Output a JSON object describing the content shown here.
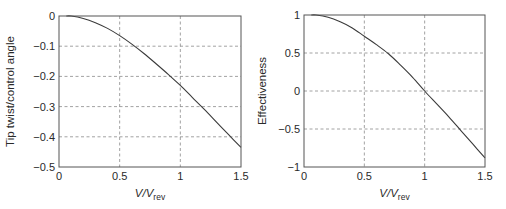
{
  "chart_data": [
    {
      "type": "line",
      "title": "",
      "xlabel": "V/V_rev",
      "xlabel_main": "V/V",
      "xlabel_sub": "rev",
      "ylabel": "Tip twist/control angle",
      "xlim": [
        0,
        1.5
      ],
      "ylim": [
        -0.5,
        0
      ],
      "xticks": [
        0,
        0.5,
        1,
        1.5
      ],
      "xtick_labels": [
        "0",
        "0.5",
        "1",
        "1.5"
      ],
      "yticks": [
        0,
        -0.1,
        -0.2,
        -0.3,
        -0.4,
        -0.5
      ],
      "ytick_labels": [
        "0",
        "−0.1",
        "−0.2",
        "−0.3",
        "−0.4",
        "−0.5"
      ],
      "grid": true,
      "legend": null,
      "series": [
        {
          "name": "Tip twist/control angle",
          "x": [
            0.1,
            0.2,
            0.3,
            0.4,
            0.5,
            0.6,
            0.7,
            0.8,
            0.9,
            1.0,
            1.1,
            1.2,
            1.3,
            1.4,
            1.5
          ],
          "y": [
            0.0,
            -0.008,
            -0.022,
            -0.041,
            -0.065,
            -0.093,
            -0.124,
            -0.158,
            -0.193,
            -0.23,
            -0.27,
            -0.31,
            -0.352,
            -0.394,
            -0.435
          ]
        }
      ]
    },
    {
      "type": "line",
      "title": "",
      "xlabel": "V/V_rev",
      "xlabel_main": "V/V",
      "xlabel_sub": "rev",
      "ylabel": "Effectiveness",
      "xlim": [
        0,
        1.5
      ],
      "ylim": [
        -1,
        1
      ],
      "xticks": [
        0,
        0.5,
        1,
        1.5
      ],
      "xtick_labels": [
        "0",
        "0.5",
        "1",
        "1.5"
      ],
      "yticks": [
        1,
        0.5,
        0,
        -0.5,
        -1
      ],
      "ytick_labels": [
        "1",
        "0.5",
        "0",
        "−0.5",
        "−1"
      ],
      "grid": true,
      "legend": null,
      "series": [
        {
          "name": "Effectiveness",
          "x": [
            0.1,
            0.2,
            0.3,
            0.4,
            0.5,
            0.6,
            0.7,
            0.8,
            0.9,
            1.0,
            1.1,
            1.2,
            1.3,
            1.4,
            1.5
          ],
          "y": [
            1.0,
            0.97,
            0.91,
            0.83,
            0.72,
            0.61,
            0.49,
            0.34,
            0.18,
            0.0,
            -0.17,
            -0.34,
            -0.52,
            -0.7,
            -0.88
          ]
        }
      ]
    }
  ],
  "plots": [
    {
      "box": {
        "left": 59,
        "top": 16,
        "right": 241,
        "bottom": 167
      }
    },
    {
      "box": {
        "left": 304,
        "top": 15,
        "right": 485,
        "bottom": 167
      }
    }
  ]
}
